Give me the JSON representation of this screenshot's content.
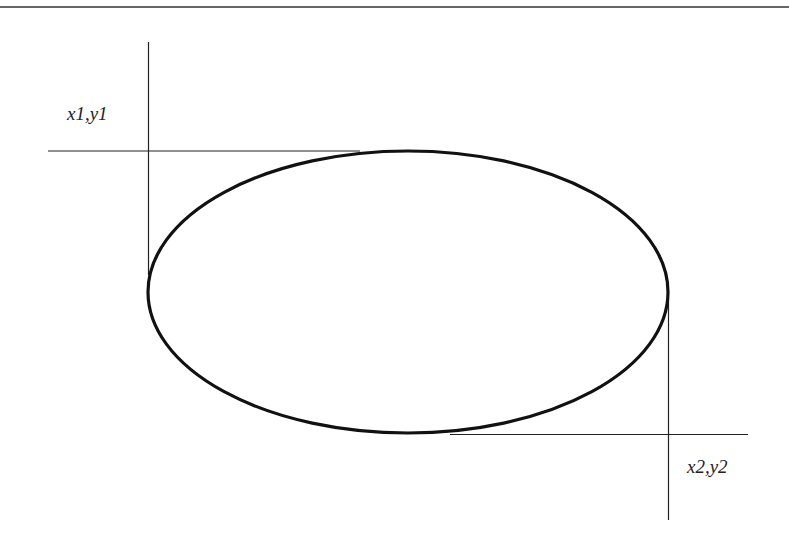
{
  "diagram": {
    "type": "ellipse-bounding-box",
    "labels": {
      "corner1": "x1,y1",
      "corner2": "x2,y2"
    },
    "colors": {
      "stroke": "#111111",
      "guide": "#222222",
      "frame": "#333333",
      "background": "#ffffff"
    },
    "geometry": {
      "ellipse": {
        "cx": 408,
        "cy": 292,
        "rx": 260,
        "ry": 141,
        "stroke_width": 3.2
      },
      "top_frame_line": {
        "x1": 0,
        "y1": 7,
        "x2": 789,
        "y2": 7
      },
      "guide_vertical_left": {
        "x1": 148.5,
        "y1": 42,
        "x2": 148.5,
        "y2": 275
      },
      "guide_horizontal_top": {
        "x1": 48,
        "y1": 151,
        "x2": 360,
        "y2": 151
      },
      "guide_vertical_right": {
        "x1": 668.5,
        "y1": 300,
        "x2": 668.5,
        "y2": 520
      },
      "guide_horizontal_bottom": {
        "x1": 450,
        "y1": 434.5,
        "x2": 748,
        "y2": 434.5
      }
    }
  }
}
